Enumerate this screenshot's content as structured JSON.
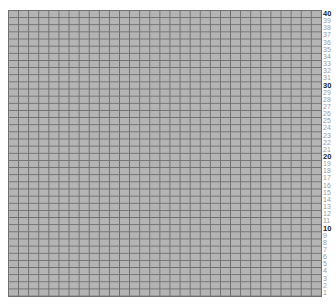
{
  "grid": {
    "rows": 40,
    "columns": 31,
    "fill_color": "#b4b4b4",
    "line_color": "#6e6e6e"
  },
  "row_labels": [
    "40",
    "39",
    "38",
    "37",
    "36",
    "35",
    "34",
    "33",
    "32",
    "31",
    "30",
    "29",
    "28",
    "27",
    "26",
    "25",
    "24",
    "23",
    "22",
    "21",
    "20",
    "19",
    "18",
    "17",
    "16",
    "15",
    "14",
    "13",
    "12",
    "11",
    "10",
    "9",
    "8",
    "7",
    "6",
    "5",
    "4",
    "3",
    "2",
    "1"
  ],
  "major_labels": [
    "40",
    "30",
    "20",
    "10"
  ]
}
